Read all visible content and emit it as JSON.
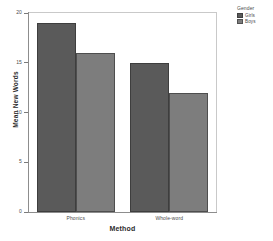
{
  "chart_data": {
    "type": "bar",
    "title": "",
    "xlabel": "Method",
    "ylabel": "Mean New Words",
    "categories": [
      "Phonics",
      "Whole-word"
    ],
    "series": [
      {
        "name": "Girls",
        "values": [
          19,
          15
        ],
        "color": "#5a5a5a"
      },
      {
        "name": "Boys",
        "values": [
          16,
          12
        ],
        "color": "#7d7d7d"
      }
    ],
    "ylim": [
      0,
      20
    ],
    "yticks": [
      0,
      5,
      10,
      15,
      20
    ],
    "ytick_labels": [
      "0",
      "5",
      "10",
      "15",
      "20"
    ],
    "grid": false,
    "legend": {
      "title": "Gender",
      "position": "right-top",
      "entries": [
        {
          "label": "Girls",
          "color": "#5a5a5a"
        },
        {
          "label": "Boys",
          "color": "#7d7d7d"
        }
      ]
    }
  }
}
